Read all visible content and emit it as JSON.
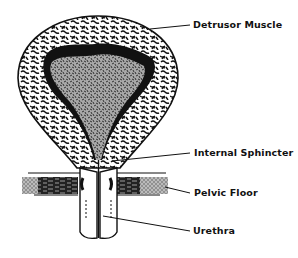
{
  "diagram": {
    "labels": [
      {
        "id": "detrusor",
        "text": "Detrusor Muscle",
        "x": 193,
        "y": 19
      },
      {
        "id": "sphincter",
        "text": "Internal Sphincter",
        "x": 194,
        "y": 147
      },
      {
        "id": "pelvic",
        "text": "Pelvic Floor",
        "x": 194,
        "y": 187
      },
      {
        "id": "urethra",
        "text": "Urethra",
        "x": 193,
        "y": 225
      }
    ],
    "leaders": [
      {
        "id": "detrusor",
        "x1": 150,
        "y1": 29,
        "x2": 190,
        "y2": 25
      },
      {
        "id": "sphincter",
        "x1": 112,
        "y1": 161,
        "x2": 190,
        "y2": 153
      },
      {
        "id": "pelvic",
        "x1": 165,
        "y1": 187,
        "x2": 190,
        "y2": 193
      },
      {
        "id": "urethra",
        "x1": 103,
        "y1": 216,
        "x2": 190,
        "y2": 231
      }
    ],
    "colors": {
      "ink": "#111111",
      "lumen": "#9a9a9a",
      "background": "#ffffff"
    }
  }
}
